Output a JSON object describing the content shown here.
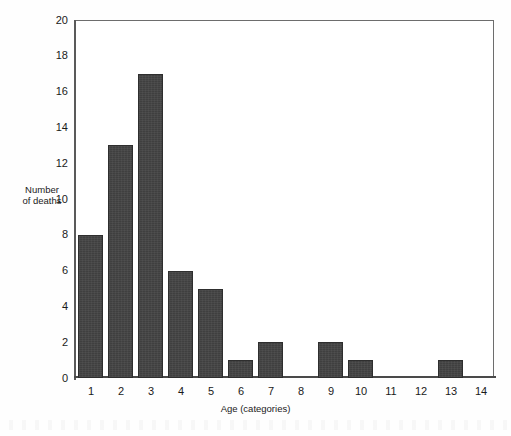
{
  "chart_data": {
    "type": "bar",
    "title": "",
    "xlabel": "Age (categories)",
    "ylabel": "Number\nof deaths",
    "ylabel_line1": "Number",
    "ylabel_line2": "of deaths",
    "categories": [
      "1",
      "2",
      "3",
      "4",
      "5",
      "6",
      "7",
      "8",
      "9",
      "10",
      "11",
      "12",
      "13",
      "14"
    ],
    "values": [
      8,
      13,
      17,
      6,
      5,
      1,
      2,
      0,
      2,
      1,
      0,
      0,
      1,
      0
    ],
    "ylim": [
      0,
      20
    ],
    "ytick_values": [
      0,
      2,
      4,
      6,
      8,
      10,
      12,
      14,
      16,
      18,
      20
    ],
    "ytick_labels": [
      "0",
      "2",
      "4",
      "6",
      "8",
      "10",
      "12",
      "14",
      "16",
      "18",
      "20"
    ],
    "grid": false,
    "legend": null,
    "bar_color": "#434343",
    "bar_edge_color": "#2e2e2e",
    "axis_color": "#5a5a5a",
    "background_color": "#ffffff",
    "text_color": "#1a1a1a"
  }
}
